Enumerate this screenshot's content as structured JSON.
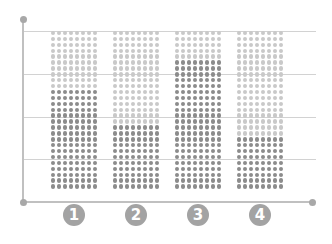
{
  "chart_data": {
    "type": "bar",
    "subtype": "dot-matrix stacked",
    "title": "",
    "xlabel": "",
    "ylabel": "",
    "categories": [
      "1",
      "2",
      "3",
      "4"
    ],
    "grid_columns_per_bar": 8,
    "total_rows": 27,
    "series": [
      {
        "name": "filled",
        "color": "#8c8c8c",
        "values": [
          17,
          11,
          22,
          9
        ]
      },
      {
        "name": "remaining",
        "color": "#c9c9c9",
        "values": [
          10,
          16,
          5,
          18
        ]
      }
    ],
    "ylim": [
      0,
      27
    ],
    "grid": true,
    "legend": "none"
  },
  "colors": {
    "dark_dot": "#8c8c8c",
    "light_dot": "#c9c9c9",
    "badge": "#a3a3a3",
    "gridline": "#d2d2d2",
    "axis": "#c0c0c0"
  },
  "badges": [
    "1",
    "2",
    "3",
    "4"
  ]
}
